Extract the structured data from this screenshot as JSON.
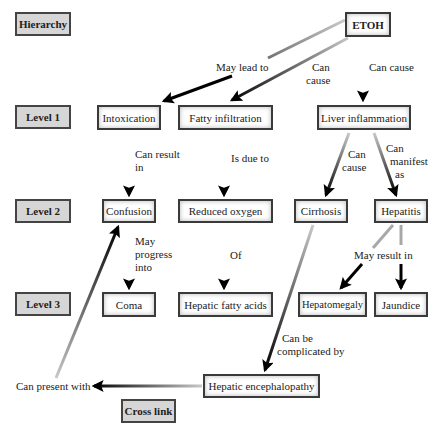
{
  "diagram": {
    "legend": {
      "hierarchy": "Hierarchy",
      "level1": "Level 1",
      "level2": "Level 2",
      "level3": "Level 3",
      "cross_link": "Cross link"
    },
    "nodes": {
      "etoh": "ETOH",
      "intoxication": "Intoxication",
      "fatty_infiltration": "Fatty infiltration",
      "liver_inflammation": "Liver inflammation",
      "confusion": "Confusion",
      "reduced_oxygen": "Reduced oxygen",
      "cirrhosis": "Cirrhosis",
      "hepatitis": "Hepatitis",
      "coma": "Coma",
      "hepatic_fatty_acids": "Hepatic fatty acids",
      "hepatomegaly": "Hepatomegaly",
      "jaundice": "Jaundice",
      "hepatic_encephalopathy": "Hepatic encephalopathy"
    },
    "edges": [
      {
        "from": "ETOH",
        "to": "Intoxication",
        "label": "May lead to"
      },
      {
        "from": "ETOH",
        "to": "Fatty infiltration",
        "label": "Can cause"
      },
      {
        "from": "ETOH",
        "to": "Liver inflammation",
        "label": "Can cause"
      },
      {
        "from": "Intoxication",
        "to": "Confusion",
        "label": "Can result in"
      },
      {
        "from": "Fatty infiltration",
        "to": "Reduced oxygen",
        "label": "Is due to"
      },
      {
        "from": "Liver inflammation",
        "to": "Cirrhosis",
        "label": "Can cause"
      },
      {
        "from": "Liver inflammation",
        "to": "Hepatitis",
        "label": "Can manifest as"
      },
      {
        "from": "Confusion",
        "to": "Coma",
        "label": "May progress into"
      },
      {
        "from": "Reduced oxygen",
        "to": "Hepatic fatty acids",
        "label": "Of"
      },
      {
        "from": "Hepatitis",
        "to": "Hepatomegaly",
        "label": "May result in"
      },
      {
        "from": "Hepatitis",
        "to": "Jaundice",
        "label": "May result in"
      },
      {
        "from": "Cirrhosis",
        "to": "Hepatic encephalopathy",
        "label": "Can be complicated by"
      },
      {
        "from": "Hepatic encephalopathy",
        "to": "Confusion",
        "label": "Can present with"
      }
    ],
    "edge_labels": {
      "may_lead_to": "May lead to",
      "can_cause_a_1": "Can",
      "can_cause_a_2": "cause",
      "can_cause_b": "Can cause",
      "can_result_in_1": "Can result",
      "can_result_in_2": "in",
      "is_due_to": "Is due to",
      "can_cause_c_1": "Can",
      "can_cause_c_2": "cause",
      "can_manifest_1": "Can",
      "can_manifest_2": "manifest",
      "can_manifest_3": "as",
      "may_progress_1": "May",
      "may_progress_2": "progress",
      "may_progress_3": "into",
      "of": "Of",
      "may_result_in": "May result in",
      "complicated_1": "Can be",
      "complicated_2": "complicated by",
      "can_present_with": "Can present with"
    }
  }
}
